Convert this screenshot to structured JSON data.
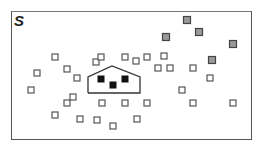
{
  "figure": {
    "label": "S",
    "colors": {
      "border": "#555555",
      "empty_square_stroke": "#555555",
      "gray_square_fill": "#999999",
      "black_square_fill": "#111111",
      "house_stroke": "#333333"
    },
    "house": {
      "points": [
        [
          88,
          93
        ],
        [
          88,
          77
        ],
        [
          112,
          66
        ],
        [
          140,
          77
        ],
        [
          140,
          93
        ]
      ]
    },
    "black_squares": [
      [
        101,
        79
      ],
      [
        113,
        85
      ],
      [
        125,
        79
      ]
    ],
    "gray_squares": [
      [
        187,
        20
      ],
      [
        166,
        37
      ],
      [
        199,
        32
      ],
      [
        233,
        44
      ],
      [
        212,
        60
      ]
    ],
    "empty_squares": [
      [
        55,
        57
      ],
      [
        67,
        69
      ],
      [
        37,
        73
      ],
      [
        77,
        78
      ],
      [
        31,
        90
      ],
      [
        96,
        62
      ],
      [
        101,
        57
      ],
      [
        125,
        57
      ],
      [
        136,
        61
      ],
      [
        147,
        57
      ],
      [
        164,
        56
      ],
      [
        158,
        68
      ],
      [
        170,
        68
      ],
      [
        193,
        68
      ],
      [
        210,
        78
      ],
      [
        182,
        90
      ],
      [
        193,
        103
      ],
      [
        233,
        103
      ],
      [
        73,
        97
      ],
      [
        67,
        103
      ],
      [
        102,
        103
      ],
      [
        125,
        103
      ],
      [
        147,
        103
      ],
      [
        55,
        115
      ],
      [
        80,
        119
      ],
      [
        97,
        120
      ],
      [
        113,
        126
      ],
      [
        137,
        119
      ]
    ]
  }
}
